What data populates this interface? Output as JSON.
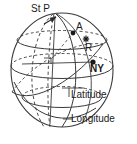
{
  "figure": {
    "background_color": "#ffffff",
    "line_color": "#3a3a3a",
    "text_color": "#1a1a1a"
  },
  "labels": {
    "pole": "St P",
    "point_a": "A",
    "point_r": "R",
    "point_ny": "NY",
    "latitude": "Latitude",
    "longitude": "Longitude"
  },
  "markers": [
    {
      "name": "point-a-marker",
      "label": "A",
      "shape": "dot",
      "x": 73,
      "y": 33
    },
    {
      "name": "point-r-marker",
      "label": "R",
      "shape": "star",
      "x": 86,
      "y": 39
    },
    {
      "name": "point-ny-marker",
      "label": "NY",
      "shape": "dot",
      "x": 93,
      "y": 62
    },
    {
      "name": "pole-marker",
      "label": "St P",
      "shape": "arrow",
      "x": 53,
      "y": 22
    }
  ],
  "geometry": {
    "sphere": {
      "cx": 62,
      "cy": 70,
      "rx": 52,
      "ry": 58
    },
    "latitude_circles": [
      {
        "name": "upper-lat",
        "cy": 40,
        "ry": 9
      },
      {
        "name": "equator",
        "cy": 66,
        "ry": 12
      },
      {
        "name": "lower-lat",
        "cy": 94,
        "ry": 11
      }
    ],
    "meridians": 3,
    "right_angle_marker": {
      "x": 46,
      "y": 60
    }
  }
}
